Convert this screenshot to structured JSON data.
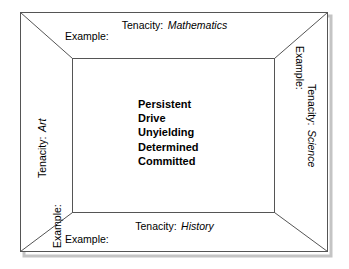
{
  "diagram": {
    "type": "concept-frame",
    "title": "Tenacity",
    "colors": {
      "background": "#ffffff",
      "line": "#555555",
      "text": "#000000",
      "shadow": "#bfbfbf"
    },
    "center": {
      "words": [
        "Persistent",
        "Drive",
        "Unyielding",
        "Determined",
        "Committed"
      ]
    },
    "panels": {
      "top": {
        "position": "top",
        "concept_label": "Tenacity:",
        "subject": "Mathematics",
        "example_label": "Example:",
        "example_value": ""
      },
      "right": {
        "position": "right",
        "concept_label": "Tenacity:",
        "subject": "Science",
        "example_label": "Example:",
        "example_value": ""
      },
      "bottom": {
        "position": "bottom",
        "concept_label": "Tenacity:",
        "subject": "History",
        "example_label": "Example:",
        "example_value": ""
      },
      "left": {
        "position": "left",
        "concept_label": "Tenacity:",
        "subject": "Art",
        "example_label": "Example:",
        "example_value": ""
      }
    }
  }
}
